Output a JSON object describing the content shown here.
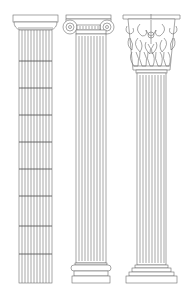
{
  "illustration": {
    "subject": "Three classical column orders",
    "columns": [
      {
        "order": "doric",
        "label": "Doric column"
      },
      {
        "order": "ionic",
        "label": "Ionic column"
      },
      {
        "order": "corinthian",
        "label": "Corinthian column"
      }
    ],
    "colors": {
      "background": "#ffffff",
      "line": "#6b6b6b"
    }
  }
}
